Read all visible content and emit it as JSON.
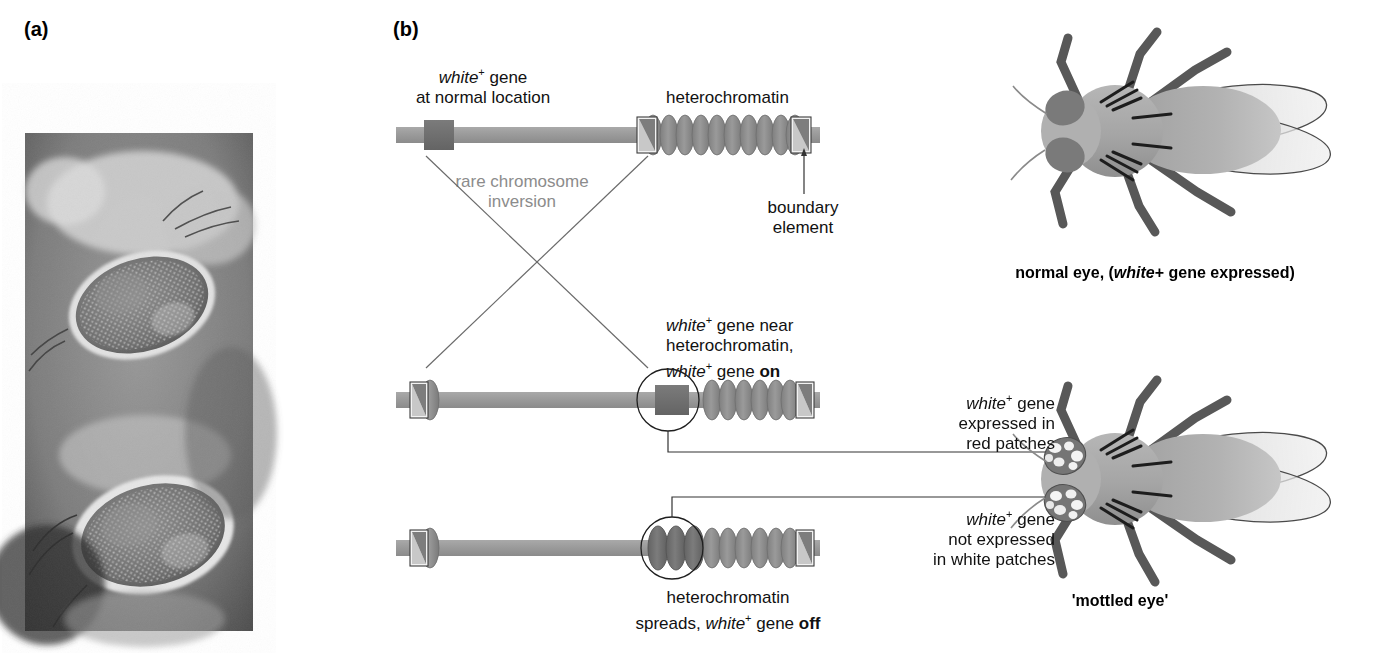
{
  "figure": {
    "type": "diagram",
    "panels": [
      {
        "letter": "(a)",
        "kind": "photograph",
        "description": "light micrograph of two Drosophila compound eyes, mottled pigmentation"
      },
      {
        "letter": "(b)",
        "kind": "schematic",
        "description": "chromosome inversion moves white+ gene next to heterochromatin"
      }
    ]
  },
  "panel_a": {
    "letter": "(a)",
    "photo_alt": "two Drosophila compound eyes showing mottled red and white ommatidia"
  },
  "panel_b": {
    "letter": "(b)",
    "labels": {
      "white_gene_normal_line1": "white",
      "white_gene_normal_sup": "+",
      "white_gene_normal_line1b": " gene",
      "white_gene_normal_line2": "at normal location",
      "heterochromatin": "heterochromatin",
      "boundary_element_line1": "boundary",
      "boundary_element_line2": "element",
      "inversion_line1": "rare chromosome",
      "inversion_line2": "inversion",
      "near_het_line1_a": "white",
      "near_het_line1_sup": "+",
      "near_het_line1_b": " gene near",
      "near_het_line2": "heterochromatin,",
      "near_het_line3_a": "white",
      "near_het_line3_sup": "+",
      "near_het_line3_b": " gene ",
      "near_het_line3_bold": "on",
      "spreads_line1": "heterochromatin",
      "spreads_line2_a": "spreads, ",
      "spreads_line2_italic": "white",
      "spreads_line2_sup": "+",
      "spreads_line2_b": " gene ",
      "spreads_line2_bold": "off"
    },
    "chromosomes": [
      {
        "id": "normal",
        "state": "white+ gene at normal location, far from heterochromatin"
      },
      {
        "id": "inverted-on",
        "state": "white+ gene near heterochromatin, white+ gene on"
      },
      {
        "id": "inverted-off",
        "state": "heterochromatin spreads, white+ gene off"
      }
    ]
  },
  "flies": {
    "normal": {
      "caption_a": "normal eye, (",
      "caption_italic": "white",
      "caption_sup": "+",
      "caption_b": " gene expressed)",
      "eye": "uniform dark (red) eye"
    },
    "mottled": {
      "caption": "'mottled eye'",
      "eye": "patchy red and white eye",
      "annotation_red": {
        "line1_italic": "white",
        "line1_sup": "+",
        "line1_b": " gene",
        "line2": "expressed in",
        "line3": "red patches"
      },
      "annotation_white": {
        "line1_italic": "white",
        "line1_sup": "+",
        "line1_b": " gene",
        "line2": "not expressed",
        "line3": "in white patches"
      }
    }
  },
  "colors": {
    "chromosome_arm": "#9a9a9a",
    "gene_box": "#6e6e6e",
    "coil": "#8e8e8e",
    "coil_dark": "#6a6a6a",
    "boundary_fill": "#7d7d7d",
    "line": "#555555",
    "gray_text": "#8c8c8c",
    "fly_body": "#a8a8a8",
    "fly_leg": "#585858",
    "fly_eye": "#808080",
    "wing": "#d8d8d8"
  }
}
